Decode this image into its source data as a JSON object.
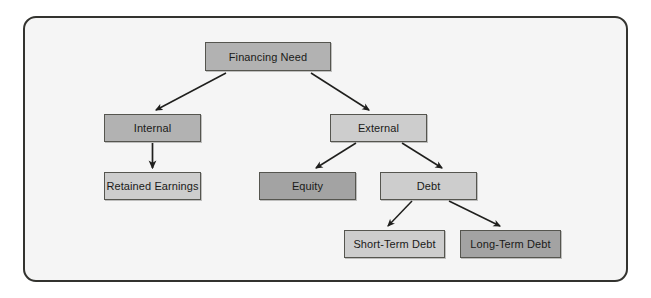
{
  "diagram": {
    "type": "tree-hierarchy",
    "frame": {
      "border_color": "#33332f",
      "background_color": "#f5f5f5",
      "corner_radius": "13px"
    },
    "palette": {
      "fill_medium": "#b2b2b2",
      "fill_light": "#cdcdcd",
      "fill_dark": "#a3a3a3",
      "node_border": "#55554f",
      "edge_color": "#1f1f1d",
      "text_color": "#1a1a18"
    },
    "nodes": [
      {
        "id": "financing-need",
        "label": "Financing Need",
        "level": 0,
        "shade": "medium"
      },
      {
        "id": "internal",
        "label": "Internal",
        "level": 1,
        "shade": "medium"
      },
      {
        "id": "external",
        "label": "External",
        "level": 1,
        "shade": "light"
      },
      {
        "id": "retained",
        "label": "Retained Earnings",
        "level": 2,
        "shade": "light"
      },
      {
        "id": "equity",
        "label": "Equity",
        "level": 2,
        "shade": "dark"
      },
      {
        "id": "debt",
        "label": "Debt",
        "level": 2,
        "shade": "light"
      },
      {
        "id": "short-term-debt",
        "label": "Short-Term Debt",
        "level": 3,
        "shade": "light"
      },
      {
        "id": "long-term-debt",
        "label": "Long-Term Debt",
        "level": 3,
        "shade": "dark"
      }
    ],
    "edges": [
      {
        "from": "financing-need",
        "to": "internal",
        "style": "diagonal-arrow"
      },
      {
        "from": "financing-need",
        "to": "external",
        "style": "diagonal-arrow"
      },
      {
        "from": "internal",
        "to": "retained",
        "style": "vertical-arrow"
      },
      {
        "from": "external",
        "to": "equity",
        "style": "diagonal-arrow"
      },
      {
        "from": "external",
        "to": "debt",
        "style": "diagonal-arrow"
      },
      {
        "from": "debt",
        "to": "short-term-debt",
        "style": "diagonal-arrow"
      },
      {
        "from": "debt",
        "to": "long-term-debt",
        "style": "diagonal-arrow"
      }
    ]
  }
}
